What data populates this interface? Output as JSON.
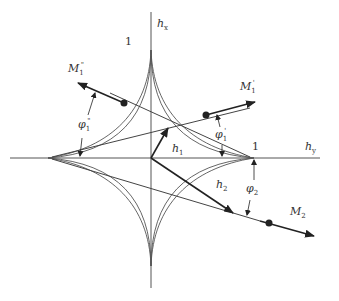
{
  "diagram": {
    "type": "astroid switching diagram",
    "colors": {
      "ink": "#333333",
      "curve": "#555555",
      "background": "#ffffff"
    },
    "axes": {
      "x_label": {
        "main": "h",
        "sub": "y"
      },
      "y_label": {
        "main": "h",
        "sub": "x"
      }
    },
    "tick_labels": {
      "x_one": "1",
      "y_one": "1"
    },
    "vectors": {
      "h1": {
        "main": "h",
        "sub": "1"
      },
      "h2": {
        "main": "h",
        "sub": "2"
      }
    },
    "magnetization": {
      "M1_prime": {
        "main": "M",
        "sub": "1",
        "sup": "'"
      },
      "M1_double_prime": {
        "main": "M",
        "sub": "1",
        "sup": "\""
      },
      "M2": {
        "main": "M",
        "sub": "2"
      }
    },
    "angles": {
      "phi1_prime": {
        "main": "φ",
        "sub": "1",
        "sup": "'"
      },
      "phi1_double_prime": {
        "main": "φ",
        "sub": "1",
        "sup": "\""
      },
      "phi2": {
        "main": "φ",
        "sub": "2"
      }
    }
  }
}
